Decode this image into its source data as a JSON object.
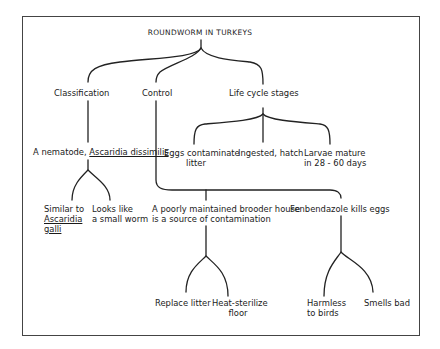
{
  "diagram": {
    "title": "ROUNDWORM IN TURKEYS",
    "branches": {
      "classification": {
        "label": "Classification",
        "child": {
          "label_prefix": "A nematode, ",
          "label_species": "Ascaridia dissimilis",
          "children": [
            {
              "line1": "Similar to",
              "line2": "Ascaridia",
              "line3": "galli"
            },
            {
              "line1": "Looks like",
              "line2": "a small worm"
            }
          ]
        }
      },
      "control": {
        "label": "Control",
        "children": [
          {
            "line1": "A poorly maintained brooder house",
            "line2": "is a source of contamination",
            "children": [
              {
                "line1": "Replace litter"
              },
              {
                "line1": "Heat-sterilize",
                "line2": "floor"
              }
            ]
          },
          {
            "line1": "Fenbendazole kills eggs",
            "children": [
              {
                "line1": "Harmless",
                "line2": "to birds"
              },
              {
                "line1": "Smells bad"
              }
            ]
          }
        ]
      },
      "life_cycle": {
        "label": "Life cycle stages",
        "children": [
          {
            "line1": "Eggs contaminate",
            "line2": "litter"
          },
          {
            "line1": "Ingested, hatch"
          },
          {
            "line1": "Larvae mature",
            "line2": "in 28 - 60 days"
          }
        ]
      }
    },
    "line_color": "#222222"
  }
}
